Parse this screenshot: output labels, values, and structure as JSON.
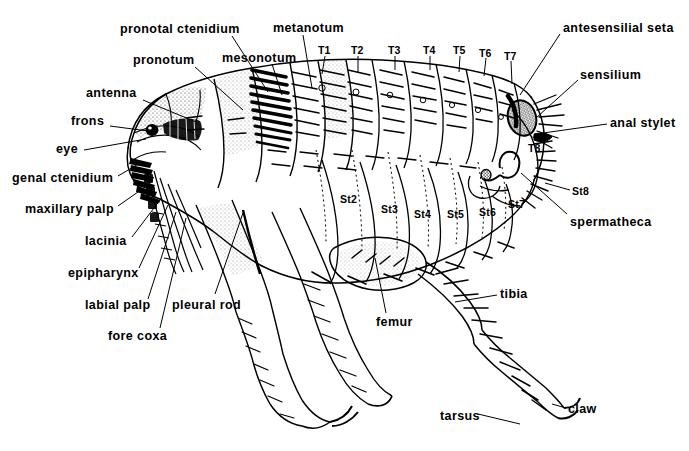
{
  "figure": {
    "view": "lateral",
    "style": "black-and-white line drawing",
    "background_color": "#ffffff",
    "ink_color": "#000000",
    "width": 689,
    "height": 451
  },
  "labels": {
    "left_column": [
      {
        "id": "pronotal-ctenidium",
        "text": "pronotal  ctenidium",
        "x": 120,
        "y": 23,
        "anchor": "left",
        "leader": [
          [
            232,
            36
          ],
          [
            268,
            92
          ]
        ]
      },
      {
        "id": "pronotum",
        "text": "pronotum",
        "x": 133,
        "y": 54,
        "anchor": "left",
        "leader": [
          [
            195,
            67
          ],
          [
            243,
            110
          ]
        ]
      },
      {
        "id": "antenna",
        "text": "antenna",
        "x": 86,
        "y": 87,
        "anchor": "left",
        "leader": [
          [
            143,
            100
          ],
          [
            196,
            122
          ]
        ]
      },
      {
        "id": "frons",
        "text": "frons",
        "x": 71,
        "y": 115,
        "anchor": "left",
        "leader": [
          [
            110,
            126
          ],
          [
            148,
            131
          ]
        ]
      },
      {
        "id": "eye",
        "text": "eye",
        "x": 56,
        "y": 143,
        "anchor": "left",
        "leader": [
          [
            84,
            150
          ],
          [
            146,
            139
          ]
        ]
      },
      {
        "id": "genal-ctenidium",
        "text": "genal  ctenidium",
        "x": 12,
        "y": 172,
        "anchor": "left",
        "leader": [
          [
            118,
            176
          ],
          [
            140,
            163
          ]
        ]
      },
      {
        "id": "maxillary-palp",
        "text": "maxillary  palp",
        "x": 25,
        "y": 203,
        "anchor": "left",
        "leader": [
          [
            118,
            206
          ],
          [
            148,
            185
          ]
        ]
      },
      {
        "id": "lacinia",
        "text": "lacinia",
        "x": 85,
        "y": 235,
        "anchor": "left",
        "leader": [
          [
            132,
            237
          ],
          [
            160,
            200
          ]
        ]
      },
      {
        "id": "epipharynx",
        "text": "epipharynx",
        "x": 68,
        "y": 267,
        "anchor": "left",
        "leader": [
          [
            139,
            268
          ],
          [
            168,
            205
          ]
        ]
      },
      {
        "id": "labial-palp",
        "text": "labial  palp",
        "x": 85,
        "y": 299,
        "anchor": "left",
        "leader": [
          [
            148,
            299
          ],
          [
            176,
            212
          ]
        ]
      },
      {
        "id": "fore-coxa",
        "text": "fore  coxa",
        "x": 108,
        "y": 330,
        "anchor": "left",
        "leader": [
          [
            160,
            328
          ],
          [
            186,
            218
          ]
        ]
      },
      {
        "id": "pleural-rod",
        "text": "pleural  rod",
        "x": 172,
        "y": 299,
        "anchor": "left",
        "leader": [
          [
            215,
            294
          ],
          [
            243,
            213
          ]
        ]
      }
    ],
    "top_column": [
      {
        "id": "mesonotum",
        "text": "mesonotum",
        "x": 222,
        "y": 52,
        "anchor": "left",
        "leader": [
          [
            272,
            64
          ],
          [
            282,
            95
          ]
        ]
      },
      {
        "id": "metanotum",
        "text": "metanotum",
        "x": 273,
        "y": 22,
        "anchor": "left",
        "leader": [
          [
            303,
            35
          ],
          [
            312,
            88
          ]
        ]
      }
    ],
    "right_column": [
      {
        "id": "antesensilial-seta",
        "text": "antesensilial  seta",
        "x": 563,
        "y": 22,
        "anchor": "left",
        "leader": [
          [
            560,
            34
          ],
          [
            520,
            95
          ]
        ]
      },
      {
        "id": "sensilium",
        "text": "sensilium",
        "x": 580,
        "y": 69,
        "anchor": "left",
        "leader": [
          [
            578,
            80
          ],
          [
            537,
            117
          ]
        ]
      },
      {
        "id": "anal-stylet",
        "text": "anal  stylet",
        "x": 610,
        "y": 117,
        "anchor": "left",
        "leader": [
          [
            607,
            124
          ],
          [
            543,
            133
          ]
        ]
      },
      {
        "id": "spermatheca",
        "text": "spermatheca",
        "x": 570,
        "y": 216,
        "anchor": "left",
        "leader": [
          [
            567,
            214
          ],
          [
            521,
            173
          ]
        ]
      },
      {
        "id": "tibia",
        "text": "tibia",
        "x": 500,
        "y": 288,
        "anchor": "left",
        "leader": [
          [
            497,
            295
          ],
          [
            455,
            302
          ]
        ]
      },
      {
        "id": "claw",
        "text": "claw",
        "x": 568,
        "y": 403,
        "anchor": "left",
        "leader": [
          [
            566,
            408
          ],
          [
            552,
            404
          ]
        ]
      }
    ],
    "bottom_column": [
      {
        "id": "femur",
        "text": "femur",
        "x": 376,
        "y": 316,
        "anchor": "left",
        "leader": [
          [
            386,
            313
          ],
          [
            375,
            258
          ]
        ]
      },
      {
        "id": "tarsus",
        "text": "tarsus",
        "x": 440,
        "y": 410,
        "anchor": "left",
        "leader": [
          [
            478,
            414
          ],
          [
            520,
            424
          ]
        ]
      }
    ],
    "tergites": [
      {
        "id": "T1",
        "text": "T1",
        "x": 318,
        "y": 45,
        "leader": [
          [
            325,
            56
          ],
          [
            322,
            74
          ]
        ]
      },
      {
        "id": "T2",
        "text": "T2",
        "x": 351,
        "y": 45,
        "leader": [
          [
            358,
            56
          ],
          [
            358,
            72
          ]
        ]
      },
      {
        "id": "T3",
        "text": "T3",
        "x": 388,
        "y": 45,
        "leader": [
          [
            395,
            56
          ],
          [
            395,
            70
          ]
        ]
      },
      {
        "id": "T4",
        "text": "T4",
        "x": 423,
        "y": 45,
        "leader": [
          [
            430,
            56
          ],
          [
            430,
            70
          ]
        ]
      },
      {
        "id": "T5",
        "text": "T5",
        "x": 453,
        "y": 45,
        "leader": [
          [
            460,
            56
          ],
          [
            459,
            72
          ]
        ]
      },
      {
        "id": "T6",
        "text": "T6",
        "x": 479,
        "y": 48,
        "leader": [
          [
            486,
            58
          ],
          [
            484,
            76
          ]
        ]
      },
      {
        "id": "T7",
        "text": "T7",
        "x": 504,
        "y": 51,
        "leader": [
          [
            511,
            61
          ],
          [
            512,
            84
          ]
        ]
      },
      {
        "id": "T8",
        "text": "T8",
        "x": 528,
        "y": 143,
        "leader": null
      }
    ],
    "sternites": [
      {
        "id": "St2",
        "text": "St2",
        "x": 340,
        "y": 194,
        "leader": null
      },
      {
        "id": "St3",
        "text": "St3",
        "x": 381,
        "y": 204,
        "leader": null
      },
      {
        "id": "St4",
        "text": "St4",
        "x": 414,
        "y": 209,
        "leader": null
      },
      {
        "id": "St5",
        "text": "St5",
        "x": 447,
        "y": 209,
        "leader": null
      },
      {
        "id": "St6",
        "text": "St6",
        "x": 479,
        "y": 207,
        "leader": null
      },
      {
        "id": "St7",
        "text": "St7",
        "x": 508,
        "y": 199,
        "leader": null
      },
      {
        "id": "St8",
        "text": "St8",
        "x": 572,
        "y": 186,
        "leader": [
          [
            570,
            190
          ],
          [
            545,
            183
          ]
        ]
      }
    ]
  }
}
